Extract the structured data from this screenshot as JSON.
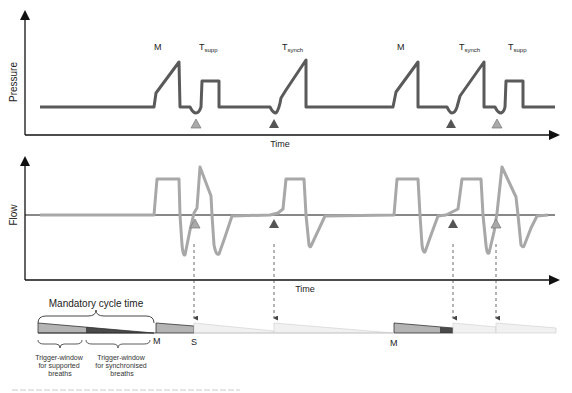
{
  "pressure_panel": {
    "y_label": "Pressure",
    "x_label": "Time",
    "breath_labels": [
      {
        "main": "M",
        "sub": ""
      },
      {
        "main": "T",
        "sub": "supp"
      },
      {
        "main": "T",
        "sub": "synch"
      },
      {
        "main": "M",
        "sub": ""
      },
      {
        "main": "T",
        "sub": "synch"
      },
      {
        "main": "T",
        "sub": "supp"
      }
    ]
  },
  "flow_panel": {
    "y_label": "Flow",
    "x_label": "Time"
  },
  "timing_bar": {
    "title": "Mandatory cycle time",
    "markers": [
      "M",
      "S",
      "M"
    ],
    "windows": [
      {
        "label_line1": "Trigger-window",
        "label_line2": "for supported",
        "label_line3": "breaths"
      },
      {
        "label_line1": "Trigger-window",
        "label_line2": "for synchronised",
        "label_line3": "breaths"
      }
    ]
  },
  "legend": {
    "supported_trigger_color": "#a9a9a9",
    "synchronised_trigger_color": "#555555",
    "pressure_trace_color": "#5a5a5a",
    "flow_trace_color": "#a8a8a8"
  }
}
